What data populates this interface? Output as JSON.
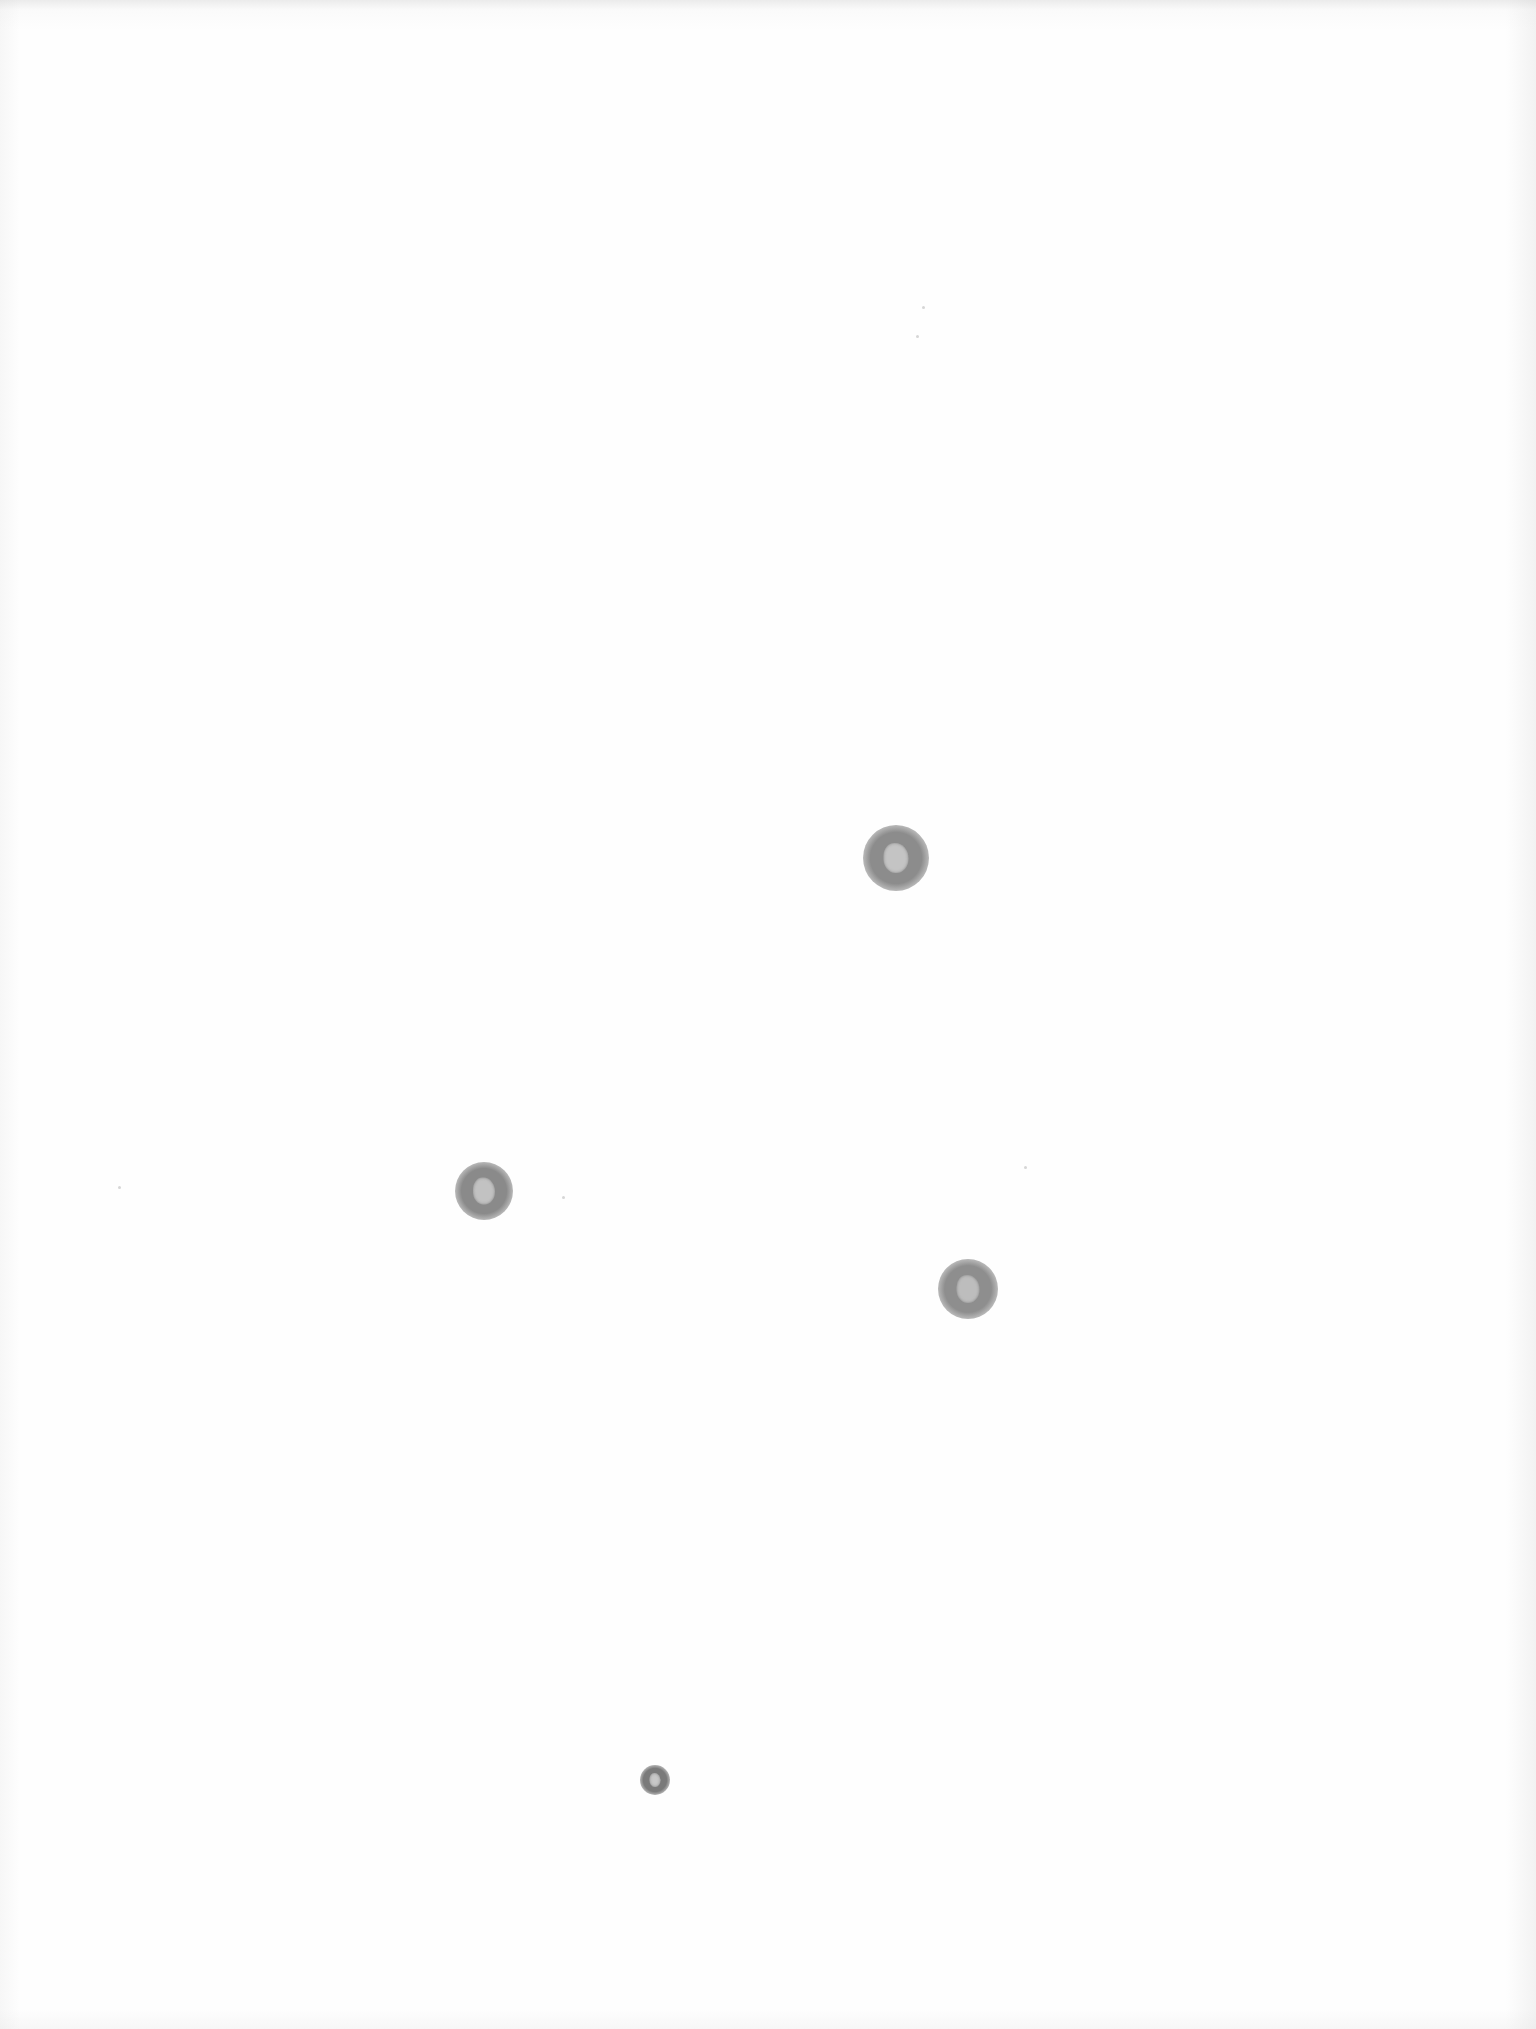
{
  "scene": {
    "description": "Scanned sheet of blank white paper with four gray circular stains",
    "background_color": "#fdfdfd",
    "spots": [
      {
        "name": "stain-1",
        "x": 896,
        "y": 858,
        "diameter": 66,
        "ring_color": "#8c8c8c",
        "core_color": "#c4c4c4"
      },
      {
        "name": "stain-2",
        "x": 484,
        "y": 1191,
        "diameter": 58,
        "ring_color": "#8a8a8a",
        "core_color": "#c2c2c2"
      },
      {
        "name": "stain-3",
        "x": 968,
        "y": 1289,
        "diameter": 60,
        "ring_color": "#8e8e8e",
        "core_color": "#bdbdbd"
      },
      {
        "name": "stain-4",
        "x": 655,
        "y": 1780,
        "diameter": 30,
        "ring_color": "#7a7a7a",
        "core_color": "#c8c8c8"
      }
    ],
    "specks": [
      {
        "x": 922,
        "y": 306
      },
      {
        "x": 916,
        "y": 335
      },
      {
        "x": 118,
        "y": 1186
      },
      {
        "x": 562,
        "y": 1196
      },
      {
        "x": 1024,
        "y": 1166
      }
    ]
  }
}
